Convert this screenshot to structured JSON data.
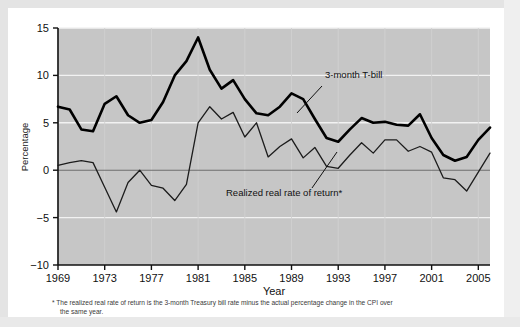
{
  "chart_data": {
    "type": "line",
    "title": "",
    "xlabel": "Year",
    "ylabel": "Percentage",
    "xlim": [
      1969,
      2006
    ],
    "ylim": [
      -10,
      15
    ],
    "ytick_labels": [
      "15",
      "10",
      "5",
      "0",
      "-5",
      "-10"
    ],
    "ytick_values": [
      15,
      10,
      5,
      0,
      -5,
      -10
    ],
    "xtick_labels": [
      "1969",
      "1973",
      "1977",
      "1981",
      "1985",
      "1989",
      "1993",
      "1997",
      "2001",
      "2005"
    ],
    "xtick_values": [
      1969,
      1973,
      1977,
      1981,
      1985,
      1989,
      1993,
      1997,
      2001,
      2005
    ],
    "grid": "horizontal white gridlines on gray plot background",
    "legend": "inline annotations with leader lines",
    "x": [
      1969,
      1970,
      1971,
      1972,
      1973,
      1974,
      1975,
      1976,
      1977,
      1978,
      1979,
      1980,
      1981,
      1982,
      1983,
      1984,
      1985,
      1986,
      1987,
      1988,
      1989,
      1990,
      1991,
      1992,
      1993,
      1994,
      1995,
      1996,
      1997,
      1998,
      1999,
      2000,
      2001,
      2002,
      2003,
      2004,
      2005,
      2006
    ],
    "series": [
      {
        "name": "3-month T-bill",
        "color": "#000000",
        "width": 2.6,
        "values": [
          6.7,
          6.4,
          4.3,
          4.1,
          7.0,
          7.8,
          5.8,
          5.0,
          5.3,
          7.2,
          10.0,
          11.5,
          14.0,
          10.6,
          8.6,
          9.5,
          7.5,
          6.0,
          5.8,
          6.7,
          8.1,
          7.5,
          5.4,
          3.4,
          3.0,
          4.3,
          5.5,
          5.0,
          5.1,
          4.8,
          4.7,
          5.9,
          3.4,
          1.6,
          1.0,
          1.4,
          3.2,
          4.5
        ]
      },
      {
        "name": "Realized real rate of return*",
        "color": "#1c1c1c",
        "width": 1.3,
        "values": [
          0.5,
          0.8,
          1.0,
          0.8,
          -1.8,
          -4.4,
          -1.3,
          0.0,
          -1.6,
          -1.9,
          -3.2,
          -1.5,
          5.0,
          6.7,
          5.4,
          6.1,
          3.5,
          5.0,
          1.4,
          2.5,
          3.3,
          1.3,
          2.4,
          0.4,
          0.2,
          1.6,
          2.9,
          1.8,
          3.2,
          3.2,
          2.0,
          2.5,
          1.9,
          -0.8,
          -1.0,
          -2.2,
          -0.2,
          1.8
        ]
      }
    ],
    "annotations": [
      {
        "text": "3-month T-bill",
        "x": 325,
        "y": 78
      },
      {
        "text": "Realized real rate of return*",
        "x": 226,
        "y": 196
      }
    ]
  },
  "footnote": {
    "line1": "* The realized real rate of return is the 3-month Treasury bill rate minus the actual percentage change in the CPI over",
    "line2": "the same year."
  },
  "colors": {
    "plot_background": "#c6c6c6",
    "gridline": "#f2f2f2",
    "zero_line": "#6e6e6e",
    "axis": "#111111",
    "card_background": "#ffffff",
    "page_background": "#e8e8e8"
  }
}
